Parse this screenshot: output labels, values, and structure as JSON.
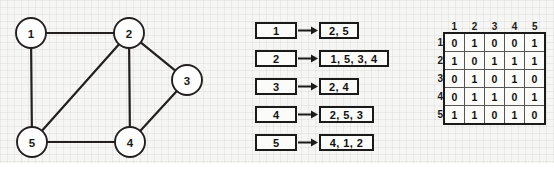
{
  "figure": {
    "background_color": "#f6f6f4",
    "ink_color": "#1a1a1a"
  },
  "graph": {
    "title": "undirected-graph",
    "nodes": [
      {
        "id": "1",
        "label": "1",
        "cx": 31,
        "cy": 33,
        "r": 15
      },
      {
        "id": "2",
        "label": "2",
        "cx": 129,
        "cy": 33,
        "r": 15
      },
      {
        "id": "3",
        "label": "3",
        "cx": 187,
        "cy": 80,
        "r": 15
      },
      {
        "id": "4",
        "label": "4",
        "cx": 130,
        "cy": 142,
        "r": 15
      },
      {
        "id": "5",
        "label": "5",
        "cx": 32,
        "cy": 142,
        "r": 15
      }
    ],
    "edges": [
      {
        "from": "1",
        "to": "2"
      },
      {
        "from": "1",
        "to": "5"
      },
      {
        "from": "2",
        "to": "5"
      },
      {
        "from": "2",
        "to": "3"
      },
      {
        "from": "2",
        "to": "4"
      },
      {
        "from": "3",
        "to": "4"
      },
      {
        "from": "4",
        "to": "5"
      }
    ]
  },
  "adjacency_list": {
    "title": "adjacency-list",
    "rows": [
      {
        "key": "1",
        "neighbors": "2, 5",
        "value_width": 40,
        "top": 0
      },
      {
        "key": "2",
        "neighbors": "1, 5, 3, 4",
        "value_width": 70,
        "top": 28
      },
      {
        "key": "3",
        "neighbors": "2, 4",
        "value_width": 40,
        "top": 56
      },
      {
        "key": "4",
        "neighbors": "2, 5, 3",
        "value_width": 55,
        "top": 84
      },
      {
        "key": "5",
        "neighbors": "4, 1, 2",
        "value_width": 55,
        "top": 112
      }
    ]
  },
  "adjacency_matrix": {
    "title": "adjacency-matrix",
    "column_headers": [
      "1",
      "2",
      "3",
      "4",
      "5"
    ],
    "row_headers": [
      "1",
      "2",
      "3",
      "4",
      "5"
    ],
    "rows": [
      [
        "0",
        "1",
        "0",
        "0",
        "1"
      ],
      [
        "1",
        "0",
        "1",
        "1",
        "1"
      ],
      [
        "0",
        "1",
        "0",
        "1",
        "0"
      ],
      [
        "0",
        "1",
        "1",
        "0",
        "1"
      ],
      [
        "1",
        "1",
        "0",
        "1",
        "0"
      ]
    ]
  },
  "chart_data": {
    "type": "diagram",
    "vertices": [
      "1",
      "2",
      "3",
      "4",
      "5"
    ],
    "edges": [
      [
        "1",
        "2"
      ],
      [
        "1",
        "5"
      ],
      [
        "2",
        "5"
      ],
      [
        "2",
        "3"
      ],
      [
        "2",
        "4"
      ],
      [
        "3",
        "4"
      ],
      [
        "4",
        "5"
      ]
    ],
    "adjacency_list": {
      "1": [
        "2",
        "5"
      ],
      "2": [
        "1",
        "5",
        "3",
        "4"
      ],
      "3": [
        "2",
        "4"
      ],
      "4": [
        "2",
        "5",
        "3"
      ],
      "5": [
        "4",
        "1",
        "2"
      ]
    },
    "adjacency_matrix": [
      [
        0,
        1,
        0,
        0,
        1
      ],
      [
        1,
        0,
        1,
        1,
        1
      ],
      [
        0,
        1,
        0,
        1,
        0
      ],
      [
        0,
        1,
        1,
        0,
        1
      ],
      [
        1,
        1,
        0,
        1,
        0
      ]
    ],
    "matrix_labels": [
      "1",
      "2",
      "3",
      "4",
      "5"
    ]
  }
}
